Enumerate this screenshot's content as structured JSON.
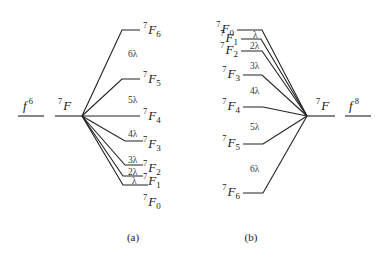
{
  "panels": [
    {
      "caption": "(a)",
      "configuration": {
        "base": "f",
        "exp": "6"
      },
      "term": {
        "sup": "7",
        "letter": "F"
      },
      "levels": [
        {
          "sup": "7",
          "letter": "F",
          "sub": "6"
        },
        {
          "sup": "7",
          "letter": "F",
          "sub": "5"
        },
        {
          "sup": "7",
          "letter": "F",
          "sub": "4"
        },
        {
          "sup": "7",
          "letter": "F",
          "sub": "3"
        },
        {
          "sup": "7",
          "letter": "F",
          "sub": "2"
        },
        {
          "sup": "7",
          "letter": "F",
          "sub": "1"
        },
        {
          "sup": "7",
          "letter": "F",
          "sub": "0"
        }
      ],
      "spacings": [
        "6λ",
        "5λ",
        "4λ",
        "3λ",
        "2λ",
        "λ"
      ]
    },
    {
      "caption": "(b)",
      "configuration": {
        "base": "f",
        "exp": "8"
      },
      "term": {
        "sup": "7",
        "letter": "F"
      },
      "levels": [
        {
          "sup": "7",
          "letter": "F",
          "sub": "0"
        },
        {
          "sup": "7",
          "letter": "F",
          "sub": "1"
        },
        {
          "sup": "7",
          "letter": "F",
          "sub": "2"
        },
        {
          "sup": "7",
          "letter": "F",
          "sub": "3"
        },
        {
          "sup": "7",
          "letter": "F",
          "sub": "4"
        },
        {
          "sup": "7",
          "letter": "F",
          "sub": "5"
        },
        {
          "sup": "7",
          "letter": "F",
          "sub": "6"
        }
      ],
      "spacings": [
        "λ",
        "2λ",
        "3λ",
        "4λ",
        "5λ",
        "6λ"
      ]
    }
  ]
}
